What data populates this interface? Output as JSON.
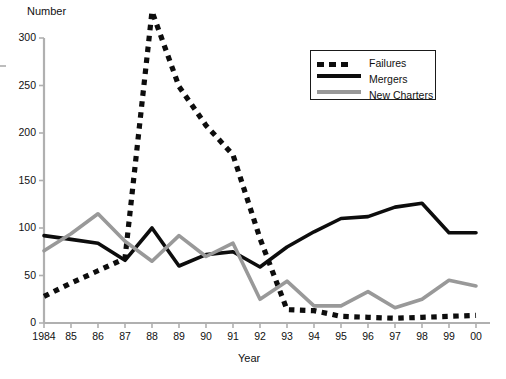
{
  "chart_data": {
    "type": "line",
    "title": "",
    "xlabel": "Year",
    "ylabel": "Number",
    "ylim": [
      0,
      300
    ],
    "yticks": [
      0,
      50,
      100,
      150,
      200,
      250,
      300
    ],
    "grid": false,
    "legend_position": "top-right",
    "x": [
      "1984",
      "85",
      "86",
      "87",
      "88",
      "89",
      "90",
      "91",
      "92",
      "93",
      "94",
      "95",
      "96",
      "97",
      "98",
      "99",
      "00"
    ],
    "x_values": [
      1984,
      1985,
      1986,
      1987,
      1988,
      1989,
      1990,
      1991,
      1992,
      1993,
      1994,
      1995,
      1996,
      1997,
      1998,
      1999,
      2000
    ],
    "series": [
      {
        "name": "Failures",
        "style": "dotted",
        "color": "#0d0d0d",
        "values": [
          28,
          42,
          55,
          68,
          328,
          249,
          208,
          177,
          89,
          14,
          13,
          7,
          6,
          5,
          6,
          7,
          8
        ]
      },
      {
        "name": "Mergers",
        "style": "solid",
        "color": "#0d0d0d",
        "values": [
          92,
          88,
          84,
          66,
          100,
          60,
          72,
          75,
          59,
          80,
          96,
          110,
          112,
          122,
          126,
          95,
          95
        ]
      },
      {
        "name": "New Charters",
        "style": "solid",
        "color": "#999999",
        "values": [
          76,
          94,
          115,
          86,
          65,
          92,
          70,
          84,
          25,
          44,
          18,
          18,
          33,
          16,
          25,
          45,
          39
        ]
      }
    ]
  },
  "legend": {
    "entries": [
      {
        "label": "Failures"
      },
      {
        "label": "Mergers"
      },
      {
        "label": "New Charters"
      }
    ]
  },
  "axes": {
    "y_title": "Number",
    "x_title": "Year",
    "y_tick_labels": [
      "300",
      "250",
      "200",
      "150",
      "100",
      "50",
      "0"
    ],
    "x_tick_labels": [
      "1984",
      "85",
      "86",
      "87",
      "88",
      "89",
      "90",
      "91",
      "92",
      "93",
      "94",
      "95",
      "96",
      "97",
      "98",
      "99",
      "00"
    ]
  }
}
